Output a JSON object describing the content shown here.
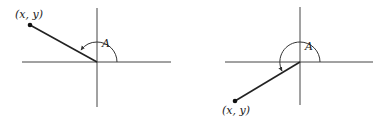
{
  "figures": [
    {
      "id": "left",
      "quadrant": "II",
      "point_label": "(x, y)",
      "angle_label": "A",
      "origin": [
        97,
        62
      ],
      "point": [
        30,
        25
      ],
      "axes": {
        "x_from": 22,
        "x_to": 171,
        "y_from": 8,
        "y_to": 107
      }
    },
    {
      "id": "right",
      "quadrant": "III",
      "point_label": "(x, y)",
      "angle_label": "A",
      "origin": [
        300,
        62
      ],
      "point": [
        235,
        101
      ],
      "axes": {
        "x_from": 225,
        "x_to": 373,
        "y_from": 7,
        "y_to": 105
      }
    }
  ],
  "colors": {
    "ink": "#222222",
    "background": "#ffffff"
  }
}
